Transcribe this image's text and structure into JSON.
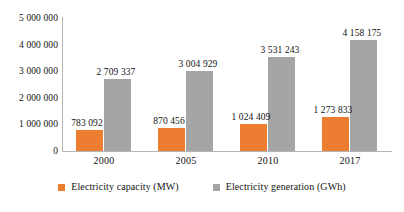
{
  "chart_data": {
    "type": "bar",
    "title": "",
    "subtitle": "",
    "xlabel": "",
    "ylabel": "",
    "categories": [
      "2000",
      "2005",
      "2010",
      "2017"
    ],
    "series": [
      {
        "name": "Electricity capacity (MW)",
        "color": "#ED7D31",
        "values": [
          783092,
          870456,
          1024409,
          1273833
        ],
        "labels": [
          "783 092",
          "870 456",
          "1 024 409",
          "1 273 833"
        ]
      },
      {
        "name": "Electricity generation (GWh)",
        "color": "#A5A5A5",
        "values": [
          2709337,
          3004929,
          3531243,
          4158175
        ],
        "labels": [
          "2 709 337",
          "3 004 929",
          "3 531 243",
          "4 158 175"
        ]
      }
    ],
    "ylim": [
      0,
      5000000
    ],
    "ytick_values": [
      5000000,
      4000000,
      3000000,
      2000000,
      1000000,
      0
    ],
    "ytick_labels": [
      "5 000 000",
      "4 000 000",
      "3 000 000",
      "2 000 000",
      "1 000 000",
      "0"
    ],
    "grid": false,
    "legend_position": "bottom",
    "data_labels": true
  },
  "legend": {
    "items": [
      {
        "label": "Electricity capacity (MW)",
        "color": "#ED7D31"
      },
      {
        "label": "Electricity generation (GWh)",
        "color": "#A5A5A5"
      }
    ]
  }
}
